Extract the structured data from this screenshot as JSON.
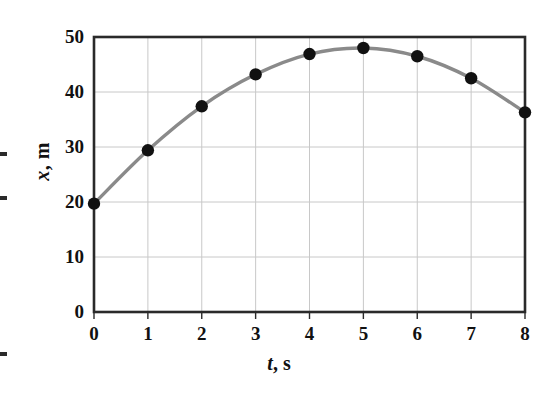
{
  "chart_data": {
    "type": "line",
    "title": "",
    "xlabel_symbol": "t",
    "xlabel_unit": ", s",
    "ylabel_symbol": "x",
    "ylabel_unit": ", m",
    "x": [
      0,
      1,
      2,
      3,
      4,
      5,
      6,
      7,
      8
    ],
    "values": [
      19.7,
      29.4,
      37.4,
      43.2,
      46.9,
      48.0,
      46.5,
      42.5,
      36.3
    ],
    "series": [
      {
        "name": "position",
        "values": [
          19.7,
          29.4,
          37.4,
          43.2,
          46.9,
          48.0,
          46.5,
          42.5,
          36.3
        ]
      }
    ],
    "xlim": [
      0,
      8
    ],
    "ylim": [
      0,
      50
    ],
    "xticks": [
      "0",
      "1",
      "2",
      "3",
      "4",
      "5",
      "6",
      "7",
      "8"
    ],
    "yticks": [
      "0",
      "10",
      "20",
      "30",
      "40",
      "50"
    ],
    "xtick_values": [
      0,
      1,
      2,
      3,
      4,
      5,
      6,
      7,
      8
    ],
    "ytick_values": [
      0,
      10,
      20,
      30,
      40,
      50
    ],
    "grid": true,
    "legend": "none",
    "marker": "filled-circle",
    "line_color": "#8a8a8a",
    "marker_color": "#111111",
    "grid_color": "#c8c8c8",
    "axis_color": "#2a2a2a",
    "background": "#ffffff"
  }
}
